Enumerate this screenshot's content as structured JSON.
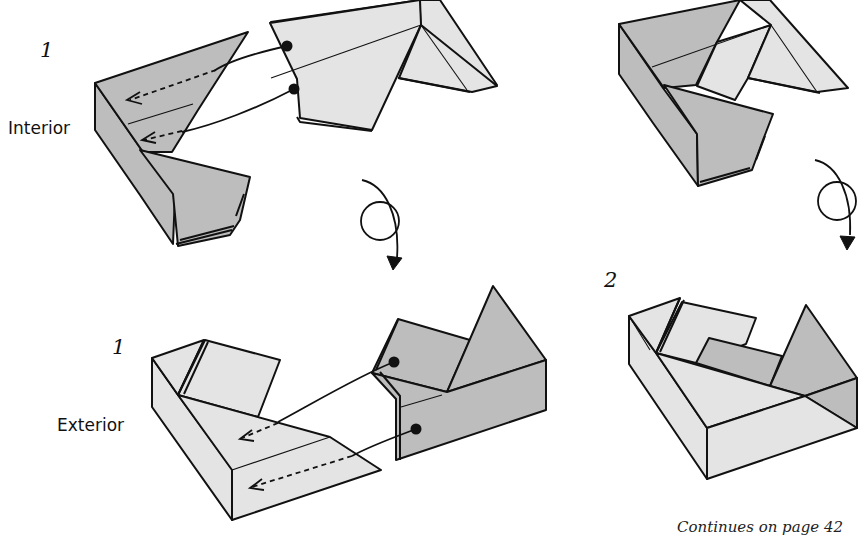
{
  "diagram": {
    "type": "origami-instructions",
    "panels": [
      {
        "id": "top-left",
        "step_number": "1",
        "view_label": "Interior",
        "description": "Two pieces: left piece interior view with two dashed insertion arrows; right piece with two dot markers connected by curved lines"
      },
      {
        "id": "top-right",
        "step_number": "2",
        "description": "Pieces joined, interior view"
      },
      {
        "id": "bottom-left",
        "step_number": "1",
        "view_label": "Exterior",
        "description": "Two pieces: left piece exterior view with two dashed insertion arrows; right piece with two dot markers connected by curved lines"
      },
      {
        "id": "bottom-right",
        "step_number": "2",
        "description": "Pieces joined, exterior view"
      }
    ],
    "turn_over_symbols": [
      {
        "id": "turn-over-left",
        "meaning": "turn over"
      },
      {
        "id": "turn-over-right",
        "meaning": "turn over"
      }
    ],
    "footer": "Continues on page 42",
    "colors": {
      "paper_dark": "#bdbdbd",
      "paper_light": "#e4e4e4",
      "line": "#111111",
      "background": "#ffffff"
    }
  }
}
